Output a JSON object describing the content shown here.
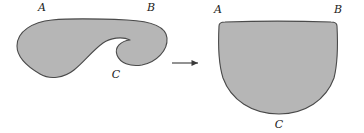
{
  "figure": {
    "background_color": "#ffffff",
    "shape_fill_color": "#b6b6b6",
    "shape_stroke_color": "#4a4a4a",
    "label_color": "#1a1a1a",
    "arrow_color": "#3a3a3a",
    "left_shape": {
      "name": "notched-blob",
      "description": "filled gray region with a hook shaped notch cut into its right half",
      "path": "M 17 46 C 17 31, 33 22, 52 20 C 74 18, 104 19, 127 20 C 148 21, 166 26, 167 38 C 168 50, 157 62, 142 65 C 130 67, 120 63, 117 55 C 114 47, 121 41, 130 40 C 122 36, 110 38, 103 43 C 92 51, 85 61, 74 70 C 64 78, 50 80, 40 74 C 28 67, 17 58, 17 46 Z",
      "labels": [
        {
          "id": "left-label-A",
          "text": "A",
          "x": 42,
          "y": 11
        },
        {
          "id": "left-label-B",
          "text": "B",
          "x": 151,
          "y": 11
        },
        {
          "id": "left-label-C",
          "text": "C",
          "x": 116,
          "y": 78
        }
      ]
    },
    "arrow": {
      "name": "transformation-arrow",
      "text": "",
      "x1": 172,
      "y1": 63,
      "x2": 198,
      "y2": 63
    },
    "right_shape": {
      "name": "filled-disk-blob",
      "description": "filled gray region, flat top edge with rounded upper corners and a round bottom",
      "path": "M 219 26 C 219 23, 221 22, 225 22 C 255 21, 300 21, 331 22 C 335 22, 337 23, 337 26 C 338 45, 338 62, 334 78 C 326 100, 305 114, 279 114 C 252 114, 231 100, 223 78 C 218 62, 218 45, 219 26 Z",
      "labels": [
        {
          "id": "right-label-A",
          "text": "A",
          "x": 218,
          "y": 13
        },
        {
          "id": "right-label-B",
          "text": "B",
          "x": 338,
          "y": 13
        },
        {
          "id": "right-label-C",
          "text": "C",
          "x": 279,
          "y": 128
        }
      ]
    }
  }
}
